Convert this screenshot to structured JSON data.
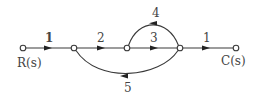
{
  "diagram": {
    "type": "signal-flow-graph",
    "nodes": [
      {
        "id": "n1",
        "label": "R(s)",
        "x": 23,
        "y": 48
      },
      {
        "id": "n2",
        "label": "",
        "x": 74,
        "y": 48
      },
      {
        "id": "n3",
        "label": "",
        "x": 127,
        "y": 48
      },
      {
        "id": "n4",
        "label": "",
        "x": 180,
        "y": 48
      },
      {
        "id": "n5",
        "label": "C(s)",
        "x": 236,
        "y": 48
      }
    ],
    "edges": [
      {
        "from": "n1",
        "to": "n2",
        "gain": "1"
      },
      {
        "from": "n2",
        "to": "n3",
        "gain": "2"
      },
      {
        "from": "n3",
        "to": "n4",
        "gain": "3"
      },
      {
        "from": "n4",
        "to": "n3",
        "gain": "4",
        "shape": "arc-above"
      },
      {
        "from": "n4",
        "to": "n2",
        "gain": "5",
        "shape": "arc-below"
      },
      {
        "from": "n4",
        "to": "n5",
        "gain": "1"
      }
    ],
    "labels": {
      "input": "R(s)",
      "output": "C(s)",
      "g12": "1",
      "g23": "2",
      "g34": "3",
      "g43": "4",
      "g42": "5",
      "g45": "1"
    }
  }
}
